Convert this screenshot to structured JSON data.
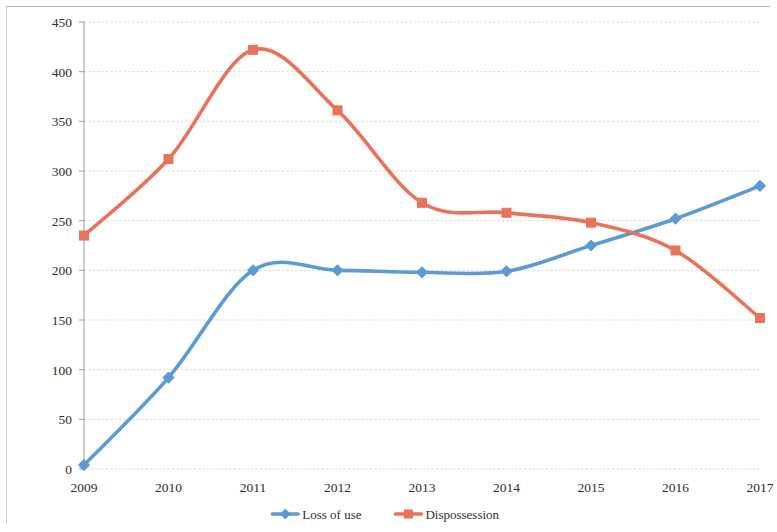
{
  "chart_data": {
    "type": "line",
    "title": "",
    "subtitle": "",
    "xlabel": "",
    "ylabel": "",
    "categories": [
      "2009",
      "2010",
      "2011",
      "2012",
      "2013",
      "2014",
      "2015",
      "2016",
      "2017"
    ],
    "series": [
      {
        "name": "Loss of use",
        "color": "#5B9BD5",
        "marker": "diamond",
        "values": [
          4,
          92,
          200,
          200,
          198,
          199,
          225,
          252,
          285
        ]
      },
      {
        "name": "Dispossession",
        "color": "#E8735A",
        "marker": "square",
        "values": [
          235,
          312,
          422,
          361,
          268,
          258,
          248,
          220,
          152
        ]
      }
    ],
    "ylim": [
      0,
      450
    ],
    "yticks": [
      0,
      50,
      100,
      150,
      200,
      250,
      300,
      350,
      400,
      450
    ],
    "ytick_labels": [
      "0",
      "50",
      "100",
      "150",
      "200",
      "250",
      "300",
      "350",
      "400",
      "450"
    ],
    "grid": true,
    "grid_axis": "y",
    "legend_position": "bottom",
    "smoothing": true
  },
  "legend": {
    "items": [
      {
        "label": "Loss of use",
        "color": "#5B9BD5",
        "marker": "diamond"
      },
      {
        "label": "Dispossession",
        "color": "#E8735A",
        "marker": "square"
      }
    ]
  }
}
